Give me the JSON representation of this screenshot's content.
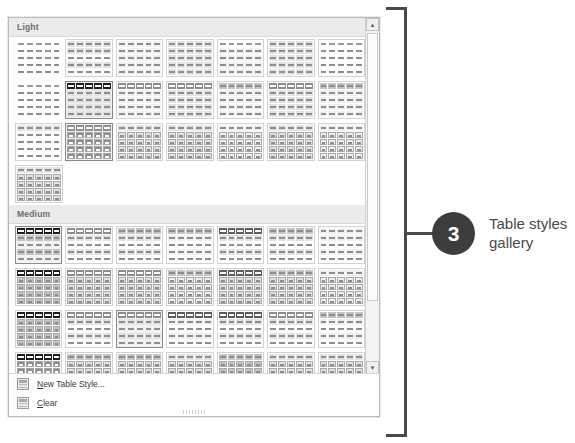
{
  "gallery": {
    "groups": [
      {
        "name": "Light",
        "label": "Light",
        "rows": [
          [
            {
              "style": "plain",
              "hdr": "none",
              "body": "none",
              "border": false,
              "selected": false,
              "cols": 5,
              "rows": 5
            },
            {
              "style": "banded",
              "hdr": "lt",
              "body": "band-lt",
              "border": true,
              "selected": false,
              "cols": 5,
              "rows": 5
            },
            {
              "style": "grid-xlt",
              "hdr": "xlt",
              "body": "xlt",
              "border": true,
              "selected": false,
              "cols": 5,
              "rows": 5
            },
            {
              "style": "grid-lt",
              "hdr": "lt",
              "body": "lt",
              "border": true,
              "selected": false,
              "cols": 5,
              "rows": 5
            },
            {
              "style": "grid-faint",
              "hdr": "none",
              "body": "xlt",
              "border": true,
              "selected": false,
              "cols": 5,
              "rows": 5
            },
            {
              "style": "grid-md",
              "hdr": "lt",
              "body": "lt",
              "border": true,
              "selected": false,
              "cols": 5,
              "rows": 5
            },
            {
              "style": "grid-plain",
              "hdr": "none",
              "body": "none",
              "border": true,
              "selected": false,
              "cols": 5,
              "rows": 5
            }
          ],
          [
            {
              "style": "faint",
              "hdr": "none",
              "body": "none",
              "border": false,
              "selected": false,
              "cols": 5,
              "rows": 5
            },
            {
              "style": "dark-hdr",
              "hdr": "blk",
              "body": "lt",
              "border": true,
              "selected": true,
              "cols": 5,
              "rows": 5
            },
            {
              "style": "dk-hdr-a",
              "hdr": "dk",
              "body": "xlt",
              "border": true,
              "selected": false,
              "cols": 5,
              "rows": 5
            },
            {
              "style": "dk-hdr-b",
              "hdr": "dk",
              "body": "lt",
              "border": true,
              "selected": false,
              "cols": 5,
              "rows": 5
            },
            {
              "style": "dk-hdr-c",
              "hdr": "md",
              "body": "xlt",
              "border": true,
              "selected": false,
              "cols": 5,
              "rows": 5
            },
            {
              "style": "dk-hdr-d",
              "hdr": "dk",
              "body": "lt",
              "border": true,
              "selected": false,
              "cols": 5,
              "rows": 5
            },
            {
              "style": "dk-hdr-e",
              "hdr": "md",
              "body": "xlt",
              "border": true,
              "selected": false,
              "cols": 5,
              "rows": 5
            }
          ],
          [
            {
              "style": "col-hdr",
              "hdr": "lt",
              "body": "none",
              "border": true,
              "selected": false,
              "cols": 5,
              "rows": 5
            },
            {
              "style": "cellgrid-dk",
              "hdr": "dk",
              "body": "cells-dk",
              "border": true,
              "selected": true,
              "cols": 5,
              "rows": 5
            },
            {
              "style": "cellgrid-a",
              "hdr": "lt",
              "body": "cells-lt",
              "border": true,
              "selected": false,
              "cols": 5,
              "rows": 5
            },
            {
              "style": "cellgrid-b",
              "hdr": "lt",
              "body": "cells-lt",
              "border": true,
              "selected": false,
              "cols": 5,
              "rows": 5
            },
            {
              "style": "cellgrid-c",
              "hdr": "xlt",
              "body": "cells-xlt",
              "border": true,
              "selected": false,
              "cols": 5,
              "rows": 5
            },
            {
              "style": "cellgrid-d",
              "hdr": "lt",
              "body": "cells-lt",
              "border": true,
              "selected": false,
              "cols": 5,
              "rows": 5
            },
            {
              "style": "cellgrid-e",
              "hdr": "xlt",
              "body": "cells-xlt",
              "border": true,
              "selected": false,
              "cols": 5,
              "rows": 5
            }
          ],
          [
            {
              "style": "cellgrid-f",
              "hdr": "lt",
              "body": "cells-lt",
              "border": true,
              "selected": false,
              "cols": 5,
              "rows": 5
            }
          ]
        ]
      },
      {
        "name": "Medium",
        "label": "Medium",
        "rows": [
          [
            {
              "style": "m-blk",
              "hdr": "blk",
              "body": "band-md",
              "border": true,
              "selected": true,
              "cols": 5,
              "rows": 5
            },
            {
              "style": "m-a",
              "hdr": "dk",
              "body": "band-lt",
              "border": true,
              "selected": false,
              "cols": 5,
              "rows": 5
            },
            {
              "style": "m-b",
              "hdr": "md",
              "body": "band-lt",
              "border": true,
              "selected": false,
              "cols": 5,
              "rows": 5
            },
            {
              "style": "m-c",
              "hdr": "md",
              "body": "band-xlt",
              "border": true,
              "selected": false,
              "cols": 5,
              "rows": 5
            },
            {
              "style": "m-d",
              "hdr": "xdk",
              "body": "band-lt",
              "border": true,
              "selected": false,
              "cols": 5,
              "rows": 5
            },
            {
              "style": "m-e",
              "hdr": "md",
              "body": "band-lt",
              "border": true,
              "selected": false,
              "cols": 5,
              "rows": 5
            },
            {
              "style": "m-f",
              "hdr": "xlt",
              "body": "band-xlt",
              "border": true,
              "selected": false,
              "cols": 5,
              "rows": 5
            }
          ],
          [
            {
              "style": "m-g",
              "hdr": "blk",
              "body": "cells-md",
              "border": true,
              "selected": false,
              "cols": 5,
              "rows": 5
            },
            {
              "style": "m-h",
              "hdr": "dk",
              "body": "cells-lt",
              "border": true,
              "selected": false,
              "cols": 5,
              "rows": 5
            },
            {
              "style": "m-i",
              "hdr": "dk",
              "body": "cells-lt",
              "border": true,
              "selected": false,
              "cols": 5,
              "rows": 5
            },
            {
              "style": "m-j",
              "hdr": "md",
              "body": "cells-xlt",
              "border": true,
              "selected": false,
              "cols": 5,
              "rows": 5
            },
            {
              "style": "m-k",
              "hdr": "xdk",
              "body": "cells-lt",
              "border": true,
              "selected": false,
              "cols": 5,
              "rows": 5
            },
            {
              "style": "m-l",
              "hdr": "md",
              "body": "cells-lt",
              "border": true,
              "selected": false,
              "cols": 5,
              "rows": 5
            },
            {
              "style": "m-m",
              "hdr": "xlt",
              "body": "cells-xlt",
              "border": true,
              "selected": false,
              "cols": 5,
              "rows": 5
            }
          ],
          [
            {
              "style": "m-n",
              "hdr": "blk",
              "body": "cells-md",
              "border": true,
              "selected": false,
              "cols": 5,
              "rows": 5
            },
            {
              "style": "m-o",
              "hdr": "dk",
              "body": "band-lt",
              "border": true,
              "selected": false,
              "cols": 5,
              "rows": 5
            },
            {
              "style": "m-p",
              "hdr": "dk",
              "body": "band-lt",
              "border": true,
              "selected": true,
              "cols": 5,
              "rows": 5
            },
            {
              "style": "m-q",
              "hdr": "xdk",
              "body": "band-xlt",
              "border": true,
              "selected": false,
              "cols": 5,
              "rows": 5
            },
            {
              "style": "m-r",
              "hdr": "xdk",
              "body": "band-lt",
              "border": true,
              "selected": false,
              "cols": 5,
              "rows": 5
            },
            {
              "style": "m-s",
              "hdr": "dk",
              "body": "band-lt",
              "border": true,
              "selected": false,
              "cols": 5,
              "rows": 5
            },
            {
              "style": "m-t",
              "hdr": "md",
              "body": "band-xlt",
              "border": true,
              "selected": false,
              "cols": 5,
              "rows": 5
            }
          ],
          [
            {
              "style": "m-u",
              "hdr": "blk",
              "body": "cells-dk",
              "border": true,
              "selected": false,
              "cols": 5,
              "rows": 5
            },
            {
              "style": "m-v",
              "hdr": "md",
              "body": "cells-lt",
              "border": true,
              "selected": false,
              "cols": 5,
              "rows": 5
            },
            {
              "style": "m-w",
              "hdr": "md",
              "body": "cells-lt",
              "border": true,
              "selected": false,
              "cols": 5,
              "rows": 5
            },
            {
              "style": "m-x",
              "hdr": "lt",
              "body": "cells-lt",
              "border": true,
              "selected": false,
              "cols": 5,
              "rows": 5
            },
            {
              "style": "m-y",
              "hdr": "md",
              "body": "cells-md",
              "border": true,
              "selected": false,
              "cols": 5,
              "rows": 5
            },
            {
              "style": "m-z",
              "hdr": "lt",
              "body": "cells-lt",
              "border": true,
              "selected": false,
              "cols": 5,
              "rows": 5
            },
            {
              "style": "m-aa",
              "hdr": "lt",
              "body": "cells-lt",
              "border": true,
              "selected": false,
              "cols": 5,
              "rows": 5
            }
          ]
        ]
      }
    ],
    "scrollbar": {
      "up_arrow": "scroll-up-arrow",
      "down_arrow": "scroll-down-arrow",
      "up_glyph": "▲",
      "down_glyph": "▼"
    },
    "commands": [
      {
        "id": "new-table-style",
        "accel": "N",
        "rest": "ew Table Style...",
        "icon": "new-table-style-icon"
      },
      {
        "id": "clear",
        "accel": "C",
        "rest": "lear",
        "icon": "clear-icon"
      }
    ]
  },
  "callout": {
    "number": "3",
    "text": "Table styles gallery",
    "color": "#3d3d3d"
  }
}
